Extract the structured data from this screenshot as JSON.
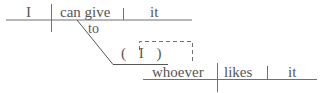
{
  "diagram": {
    "type": "sentence-diagram",
    "colors": {
      "line": "#707070",
      "text": "#555555",
      "background": "#ffffff"
    },
    "main_clause": {
      "subject": "I",
      "verb": "can give",
      "direct_object": "it",
      "preposition": "to"
    },
    "object_clause": {
      "understood_subject": "( I )",
      "subject": "whoever",
      "verb": "likes",
      "direct_object": "it"
    }
  }
}
